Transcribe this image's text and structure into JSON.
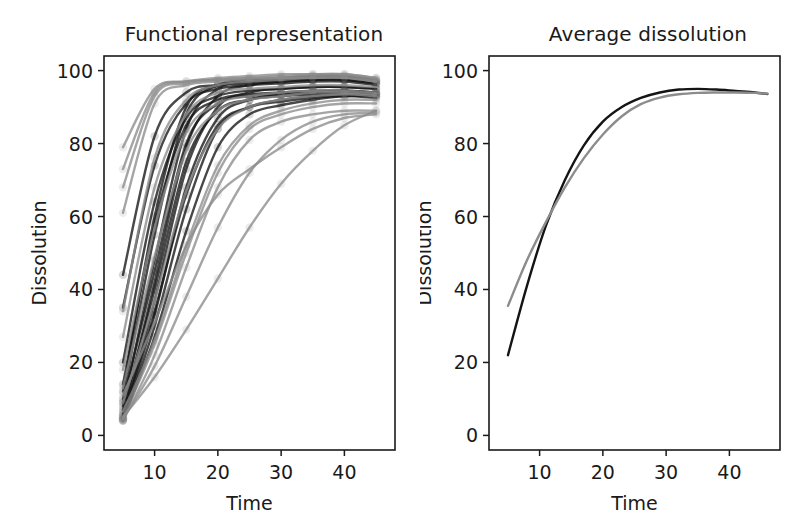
{
  "figure": {
    "width": 804,
    "height": 531,
    "background": "#ffffff",
    "dark_color": "#141414",
    "light_color": "#8c8c8c"
  },
  "panels": [
    {
      "id": "functional-representation",
      "title": "Functional representation",
      "xlabel": "Time",
      "ylabel": "Dissolution"
    },
    {
      "id": "average-dissolution",
      "title": "Average dissolution",
      "xlabel": "Time",
      "ylabel": "Dissolution"
    }
  ],
  "chart_data": [
    {
      "type": "line",
      "title": "Functional representation",
      "xlabel": "Time",
      "ylabel": "Dissolution",
      "xlim": [
        2.0,
        48.0
      ],
      "ylim": [
        -4.0,
        104.0
      ],
      "xticks": [
        10,
        20,
        30,
        40
      ],
      "yticks": [
        0,
        20,
        40,
        60,
        80,
        100
      ],
      "grid": false,
      "legend": "none",
      "x": [
        5,
        10,
        15,
        20,
        25,
        30,
        35,
        40,
        45
      ],
      "series": [
        {
          "name": "unit-01",
          "group": "dark",
          "values": [
            4.0,
            30.0,
            62.0,
            84.0,
            90.0,
            92.0,
            93.0,
            93.5,
            93.5
          ]
        },
        {
          "name": "unit-02",
          "group": "dark",
          "values": [
            4.5,
            33.0,
            68.0,
            87.0,
            92.0,
            93.5,
            94.0,
            94.5,
            94.0
          ]
        },
        {
          "name": "unit-03",
          "group": "dark",
          "values": [
            5.0,
            37.0,
            73.0,
            90.0,
            94.0,
            95.0,
            95.5,
            95.5,
            95.0
          ]
        },
        {
          "name": "unit-04",
          "group": "dark",
          "values": [
            6.0,
            42.0,
            79.0,
            93.0,
            96.0,
            97.0,
            97.5,
            97.5,
            96.5
          ]
        },
        {
          "name": "unit-05",
          "group": "dark",
          "values": [
            8.0,
            48.0,
            84.0,
            95.0,
            97.0,
            97.5,
            98.0,
            98.0,
            97.0
          ]
        },
        {
          "name": "unit-06",
          "group": "dark",
          "values": [
            10.0,
            55.0,
            88.0,
            96.0,
            97.5,
            98.0,
            98.5,
            98.5,
            97.5
          ]
        },
        {
          "name": "unit-07",
          "group": "dark",
          "values": [
            12.0,
            60.0,
            90.0,
            96.0,
            97.0,
            97.5,
            98.0,
            98.0,
            97.0
          ]
        },
        {
          "name": "unit-08",
          "group": "dark",
          "values": [
            9.0,
            45.0,
            80.0,
            91.0,
            93.0,
            93.5,
            94.0,
            94.0,
            93.5
          ]
        },
        {
          "name": "unit-09",
          "group": "dark",
          "values": [
            7.0,
            40.0,
            75.0,
            89.0,
            92.0,
            93.0,
            93.5,
            94.0,
            93.0
          ]
        },
        {
          "name": "unit-10",
          "group": "dark",
          "values": [
            5.5,
            34.0,
            66.0,
            85.0,
            90.0,
            91.5,
            92.5,
            93.0,
            92.5
          ]
        },
        {
          "name": "unit-11",
          "group": "dark",
          "values": [
            4.2,
            27.0,
            56.0,
            79.0,
            88.0,
            90.5,
            92.0,
            93.0,
            93.0
          ]
        },
        {
          "name": "unit-12",
          "group": "dark",
          "values": [
            44.0,
            82.0,
            94.0,
            96.0,
            96.5,
            97.0,
            97.5,
            97.5,
            96.5
          ]
        },
        {
          "name": "unit-13",
          "group": "dark",
          "values": [
            35.0,
            74.0,
            91.0,
            95.0,
            96.0,
            96.5,
            97.0,
            97.0,
            96.0
          ]
        },
        {
          "name": "unit-14",
          "group": "dark",
          "values": [
            20.0,
            64.0,
            87.0,
            93.0,
            94.5,
            95.0,
            95.5,
            95.5,
            95.0
          ]
        },
        {
          "name": "unit-15",
          "group": "dark",
          "values": [
            14.0,
            58.0,
            85.0,
            92.0,
            93.5,
            94.0,
            94.5,
            94.5,
            94.0
          ]
        },
        {
          "name": "unit-16",
          "group": "light",
          "values": [
            4.0,
            22.0,
            46.0,
            68.0,
            81.0,
            86.0,
            88.0,
            89.0,
            89.0
          ]
        },
        {
          "name": "unit-17",
          "group": "light",
          "values": [
            4.5,
            19.0,
            38.0,
            57.0,
            72.0,
            81.0,
            86.0,
            88.0,
            88.5
          ]
        },
        {
          "name": "unit-18",
          "group": "light",
          "values": [
            5.0,
            16.0,
            29.0,
            43.0,
            57.0,
            69.0,
            78.0,
            85.0,
            89.0
          ]
        },
        {
          "name": "unit-19",
          "group": "light",
          "values": [
            6.5,
            26.0,
            52.0,
            74.0,
            85.0,
            89.0,
            91.0,
            92.0,
            92.0
          ]
        },
        {
          "name": "unit-20",
          "group": "light",
          "values": [
            9.0,
            37.0,
            67.0,
            84.0,
            90.0,
            92.0,
            93.0,
            93.5,
            93.0
          ]
        },
        {
          "name": "unit-21",
          "group": "light",
          "values": [
            13.0,
            49.0,
            78.0,
            89.0,
            92.0,
            93.0,
            94.0,
            94.0,
            93.5
          ]
        },
        {
          "name": "unit-22",
          "group": "light",
          "values": [
            18.0,
            57.0,
            83.0,
            91.0,
            93.0,
            94.0,
            94.5,
            94.5,
            94.0
          ]
        },
        {
          "name": "unit-23",
          "group": "light",
          "values": [
            27.0,
            68.0,
            88.0,
            94.0,
            95.0,
            95.5,
            96.0,
            96.0,
            95.5
          ]
        },
        {
          "name": "unit-24",
          "group": "light",
          "values": [
            34.0,
            76.0,
            92.0,
            96.0,
            97.0,
            97.5,
            98.0,
            98.0,
            97.0
          ]
        },
        {
          "name": "unit-25",
          "group": "light",
          "values": [
            61.0,
            91.0,
            96.0,
            97.0,
            97.5,
            98.0,
            98.5,
            98.5,
            97.5
          ]
        },
        {
          "name": "unit-26",
          "group": "light",
          "values": [
            68.0,
            93.0,
            96.5,
            97.5,
            98.0,
            98.5,
            99.0,
            99.0,
            98.0
          ]
        },
        {
          "name": "unit-27",
          "group": "light",
          "values": [
            73.0,
            94.0,
            97.0,
            98.0,
            98.5,
            99.0,
            99.0,
            99.0,
            98.0
          ]
        },
        {
          "name": "unit-28",
          "group": "light",
          "values": [
            79.0,
            95.0,
            97.0,
            97.5,
            98.0,
            98.0,
            98.0,
            98.0,
            97.0
          ]
        },
        {
          "name": "unit-29",
          "group": "light",
          "values": [
            11.0,
            31.0,
            52.0,
            66.0,
            73.0,
            79.0,
            84.0,
            87.0,
            88.0
          ]
        },
        {
          "name": "unit-30",
          "group": "light",
          "values": [
            4.8,
            25.0,
            50.0,
            72.0,
            84.0,
            88.0,
            90.0,
            91.0,
            91.0
          ]
        }
      ]
    },
    {
      "type": "line",
      "title": "Average dissolution",
      "xlabel": "Time",
      "ylabel": "Dissolution",
      "xlim": [
        2.0,
        48.0
      ],
      "ylim": [
        -4.0,
        104.0
      ],
      "xticks": [
        10,
        20,
        30,
        40
      ],
      "yticks": [
        0,
        20,
        40,
        60,
        80,
        100
      ],
      "grid": false,
      "legend": "none",
      "x": [
        5,
        8,
        11,
        14,
        17,
        20,
        23,
        26,
        29,
        32,
        35,
        38,
        41,
        44,
        46
      ],
      "series": [
        {
          "name": "average-dark",
          "group": "dark",
          "values": [
            22.0,
            41.0,
            57.5,
            70.0,
            79.5,
            86.0,
            90.0,
            92.5,
            94.0,
            94.8,
            95.0,
            94.8,
            94.4,
            94.0,
            93.6
          ]
        },
        {
          "name": "average-light",
          "group": "light",
          "values": [
            35.5,
            48.0,
            58.5,
            68.0,
            76.0,
            82.5,
            87.5,
            90.8,
            92.6,
            93.5,
            93.9,
            94.0,
            94.0,
            93.9,
            93.7
          ]
        }
      ]
    }
  ]
}
